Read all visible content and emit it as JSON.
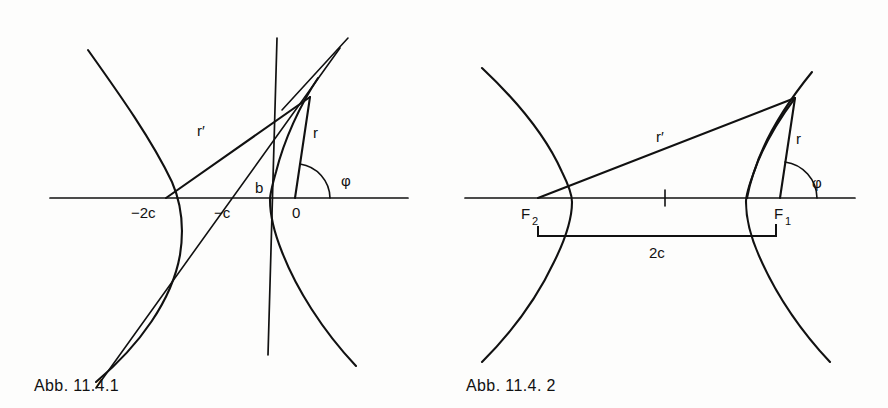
{
  "page": {
    "background": "#fdfdfc",
    "ink": "#111111",
    "width": 888,
    "height": 408
  },
  "figures": [
    {
      "id": "figure-1",
      "caption": "Abb. 11.4.1",
      "description": "Hyperbola branches with asymptotes, focal radii r and r', polar angle phi measured at origin 0",
      "labels": {
        "minus_two_c": "−2c",
        "minus_c": "−c",
        "b": "b",
        "origin": "0",
        "r": "r",
        "r_prime": "r′",
        "phi": "φ"
      },
      "geometry": {
        "axis_y": 198,
        "axis_x_start": 50,
        "axis_x_end": 408,
        "vertical_axis_x": 272,
        "vertical_axis_y_top": 38,
        "vertical_axis_y_bottom": 355,
        "origin_x": 295,
        "point_minus_2c_x": 166,
        "point_minus_c_x": 228,
        "vertex_b_x": 272,
        "point_P": [
          310,
          97
        ]
      }
    },
    {
      "id": "figure-2",
      "caption": "Abb. 11.4. 2",
      "description": "Hyperbola branches with foci F1 and F2, focal radii r and r', polar angle phi at F1, focal separation 2c",
      "labels": {
        "F1": "F",
        "F1_sub": "1",
        "F2": "F",
        "F2_sub": "2",
        "r": "r",
        "r_prime": "r′",
        "phi": "φ",
        "two_c": "2c"
      },
      "geometry": {
        "axis_y": 198,
        "axis_x_start": 21,
        "axis_x_end": 411,
        "center_tick_x": 221,
        "focus_F2_x": 94,
        "focus_F1_x": 336,
        "point_P": [
          351,
          98
        ],
        "bracket_y": 236,
        "bracket_left_x": 94,
        "bracket_right_x": 332
      }
    }
  ]
}
